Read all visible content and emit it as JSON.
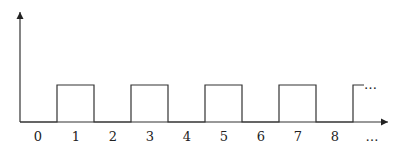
{
  "diagram": {
    "type": "square-wave",
    "x_axis": {
      "tick_labels": [
        "0",
        "1",
        "2",
        "3",
        "4",
        "5",
        "6",
        "7",
        "8",
        "…"
      ]
    },
    "pulses": [
      {
        "start": 1,
        "end": 2
      },
      {
        "start": 3,
        "end": 4
      },
      {
        "start": 5,
        "end": 6
      },
      {
        "start": 7,
        "end": 8
      },
      {
        "start": 9,
        "end": null
      }
    ],
    "continuation": "…",
    "colors": {
      "line": "#333333",
      "text": "#222222"
    }
  }
}
